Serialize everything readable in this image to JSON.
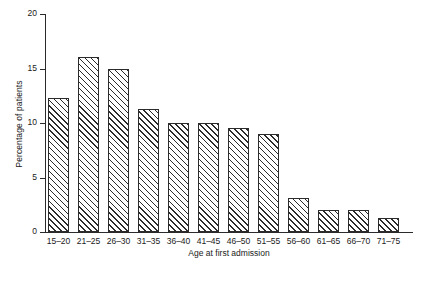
{
  "chart_data": {
    "type": "bar",
    "title": "",
    "subtitle": "",
    "xlabel": "Age at first admission",
    "ylabel": "Percentage of patients",
    "categories": [
      "15-20",
      "21-25",
      "26-30",
      "31-35",
      "36-40",
      "41-45",
      "46-50",
      "51-55",
      "56-60",
      "61-65",
      "66-70",
      "71-75"
    ],
    "values": [
      12.3,
      16.1,
      15.0,
      11.3,
      10.0,
      10.0,
      9.5,
      9.0,
      3.1,
      2.0,
      2.0,
      1.3
    ],
    "ylim": [
      0,
      20
    ],
    "yticks": [
      0,
      5,
      10,
      15,
      20
    ],
    "ytick_labels": [
      "0",
      "5",
      "10",
      "15",
      "20"
    ],
    "grid": false,
    "legend": null,
    "legend_position": "none",
    "bar_style": {
      "fill": "hatch-diagonal-forward",
      "edge_color": "#2b2b2b",
      "face_color": "#ffffff"
    },
    "annotations": []
  }
}
